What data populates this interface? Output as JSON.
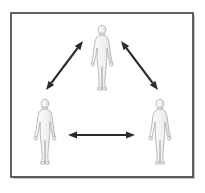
{
  "figure": {
    "title": "Three human figures connected by double-headed arrows",
    "background_color": "#ffffff",
    "frame": {
      "name": "diagram-frame",
      "x": 11,
      "y": 13,
      "width": 182,
      "height": 164,
      "stroke_color": "#3a3a3a",
      "stroke_width": 1.6,
      "fill_color": "#ffffff"
    },
    "shadow": {
      "color": "#c8c8c8",
      "offset_x": 2,
      "offset_y": 2
    }
  },
  "people": [
    {
      "id": "person-top",
      "label": "Person (top center)",
      "center_x": 102,
      "center_y": 57,
      "height": 66,
      "fill_color": "#f3f3f3",
      "stroke_color": "#b4b4b4",
      "shade_color": "#e2e2e2"
    },
    {
      "id": "person-bottom-left",
      "label": "Person (bottom left)",
      "center_x": 45,
      "center_y": 131,
      "height": 66,
      "fill_color": "#f3f3f3",
      "stroke_color": "#b4b4b4",
      "shade_color": "#e2e2e2"
    },
    {
      "id": "person-bottom-right",
      "label": "Person (bottom right)",
      "center_x": 160,
      "center_y": 131,
      "height": 66,
      "fill_color": "#f3f3f3",
      "stroke_color": "#b4b4b4",
      "shade_color": "#e2e2e2"
    }
  ],
  "arrows": [
    {
      "id": "arrow-left-diagonal",
      "label": "Double-headed arrow between bottom-left person and top person",
      "x1": 46,
      "y1": 90,
      "x2": 83,
      "y2": 41,
      "double_headed": true,
      "color": "#2b2b2b",
      "line_width": 2.2,
      "head_length": 9,
      "head_width": 7
    },
    {
      "id": "arrow-right-diagonal",
      "label": "Double-headed arrow between top person and bottom-right person",
      "x1": 121,
      "y1": 41,
      "x2": 158,
      "y2": 90,
      "double_headed": true,
      "color": "#2b2b2b",
      "line_width": 2.2,
      "head_length": 9,
      "head_width": 7
    },
    {
      "id": "arrow-bottom-horizontal",
      "label": "Double-headed arrow between bottom-left and bottom-right persons",
      "x1": 68,
      "y1": 135,
      "x2": 135,
      "y2": 135,
      "double_headed": true,
      "color": "#2b2b2b",
      "line_width": 2.2,
      "head_length": 9,
      "head_width": 7
    }
  ],
  "icons": {
    "person_icon_name": "person-silhouette-icon",
    "arrow_icon_name": "double-arrow-icon"
  }
}
